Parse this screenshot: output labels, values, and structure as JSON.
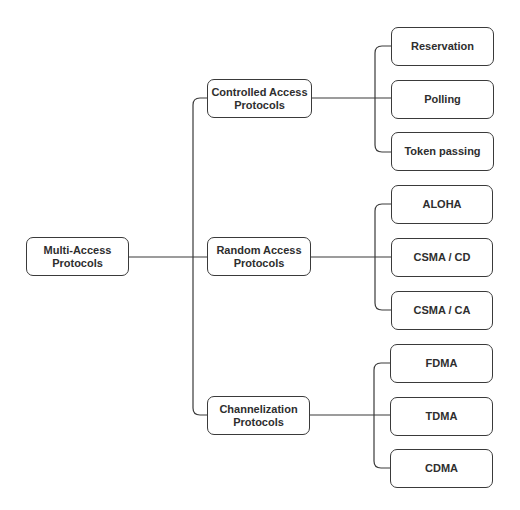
{
  "diagram": {
    "root": {
      "label": "Multi-Access\nProtocols",
      "line1": "Multi-Access",
      "line2": "Protocols"
    },
    "categories": [
      {
        "line1": "Controlled Access",
        "line2": "Protocols",
        "children": [
          "Reservation",
          "Polling",
          "Token passing"
        ]
      },
      {
        "line1": "Random Access",
        "line2": "Protocols",
        "children": [
          "ALOHA",
          "CSMA / CD",
          "CSMA / CA"
        ]
      },
      {
        "line1": "Channelization",
        "line2": "Protocols",
        "children": [
          "FDMA",
          "TDMA",
          "CDMA"
        ]
      }
    ],
    "colors": {
      "line": "#3a3a3a",
      "text": "#2e2e2e",
      "background": "#ffffff"
    }
  }
}
